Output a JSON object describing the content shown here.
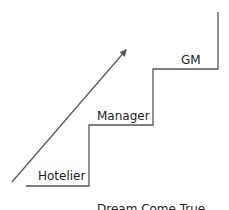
{
  "diagram": {
    "steps": [
      {
        "label": "Hotelier"
      },
      {
        "label": "Manager"
      },
      {
        "label": "GM"
      }
    ],
    "caption": "Dream Come True",
    "colors": {
      "line": "#555555",
      "text": "#222222"
    }
  }
}
